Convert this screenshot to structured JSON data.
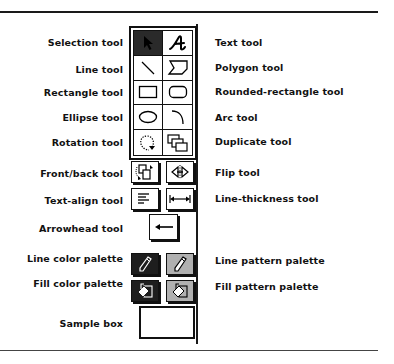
{
  "left_labels": {
    "selection": "Selection tool",
    "line": "Line tool",
    "rectangle": "Rectangle tool",
    "ellipse": "Ellipse tool",
    "rotation": "Rotation tool",
    "front_back": "Front/back tool",
    "text_align": "Text-align tool",
    "arrowhead": "Arrowhead tool",
    "line_color": "Line color palette",
    "fill_color": "Fill color palette",
    "sample_box": "Sample box"
  },
  "right_labels": {
    "text": "Text tool",
    "polygon": "Polygon tool",
    "rounded_rectangle": "Rounded-rectangle tool",
    "arc": "Arc tool",
    "duplicate": "Duplicate tool",
    "flip": "Flip tool",
    "line_thickness": "Line-thickness tool",
    "line_pattern": "Line pattern palette",
    "fill_pattern": "Fill pattern palette"
  },
  "palette": {
    "selected_tool": "Selection tool",
    "tools": [
      {
        "name": "selection",
        "icon": "arrow-pointer-icon"
      },
      {
        "name": "text",
        "icon": "script-a-icon"
      },
      {
        "name": "line",
        "icon": "diagonal-line-icon"
      },
      {
        "name": "polygon",
        "icon": "polygon-icon"
      },
      {
        "name": "rectangle",
        "icon": "rectangle-icon"
      },
      {
        "name": "rounded-rectangle",
        "icon": "rounded-rectangle-icon"
      },
      {
        "name": "ellipse",
        "icon": "ellipse-icon"
      },
      {
        "name": "arc",
        "icon": "arc-icon"
      },
      {
        "name": "rotation",
        "icon": "rotate-icon"
      },
      {
        "name": "duplicate",
        "icon": "duplicate-icon"
      }
    ]
  },
  "colors": {
    "ink": "#111111",
    "selected_cell": "#2a2a2a",
    "background": "#ffffff"
  }
}
